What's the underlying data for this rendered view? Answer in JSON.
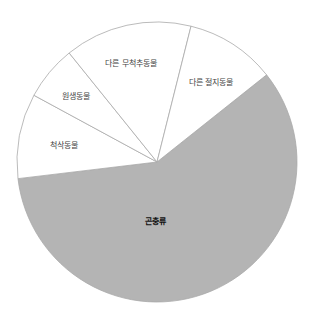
{
  "chart_data": {
    "type": "pie",
    "title": "",
    "center": [
      157,
      162
    ],
    "radius": 140,
    "start_angle_deg": -38.5,
    "slices": [
      {
        "label": "곤충류",
        "value": 58.8,
        "color": "#b4b4b4",
        "bold": true,
        "label_pos": [
          155,
          224
        ]
      },
      {
        "label": "척삭동물",
        "value": 9.8,
        "color": "#ffffff",
        "bold": false,
        "label_pos": [
          64,
          148
        ]
      },
      {
        "label": "원생동물",
        "value": 6.3,
        "color": "#ffffff",
        "bold": false,
        "label_pos": [
          76,
          99
        ]
      },
      {
        "label": "다른 무척추동물",
        "value": 14.7,
        "color": "#ffffff",
        "bold": false,
        "label_pos": [
          131,
          66
        ]
      },
      {
        "label": "다른 절지동물",
        "value": 10.4,
        "color": "#ffffff",
        "bold": false,
        "label_pos": [
          211,
          85
        ]
      }
    ],
    "stroke_color": "#aaaaaa",
    "legend": null,
    "xlabel": "",
    "ylabel": ""
  }
}
